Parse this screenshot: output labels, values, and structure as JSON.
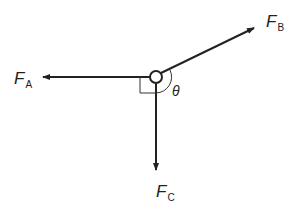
{
  "diagram": {
    "type": "force-diagram",
    "forces": [
      {
        "symbol": "F",
        "subscript": "A",
        "direction": "left"
      },
      {
        "symbol": "F",
        "subscript": "B",
        "direction": "up-right"
      },
      {
        "symbol": "F",
        "subscript": "C",
        "direction": "down"
      }
    ],
    "angle_label": "θ",
    "right_angle_marker": "between F_A and F_C",
    "colors": {
      "stroke": "#222222",
      "background": "#ffffff"
    }
  }
}
